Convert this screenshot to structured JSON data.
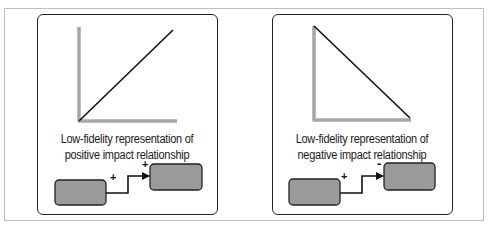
{
  "figure": {
    "panels": [
      {
        "id": "positive",
        "caption_line1": "Low-fidelity representation of",
        "caption_line2": "positive impact relationship",
        "graph": {
          "trend": "increasing",
          "line_start": [
            79,
            121
          ],
          "line_end": [
            173,
            30
          ]
        },
        "causal_link": {
          "source_sign": "+",
          "target_sign": "+"
        }
      },
      {
        "id": "negative",
        "caption_line1": "Low-fidelity representation of",
        "caption_line2": "negative impact relationship",
        "graph": {
          "trend": "decreasing",
          "line_start": [
            314,
            26
          ],
          "line_end": [
            410,
            118
          ]
        },
        "causal_link": {
          "source_sign": "+",
          "target_sign": "-"
        }
      }
    ],
    "colors": {
      "axis": "#a6a6a6",
      "trend_line": "#111111",
      "box_fill": "#9a9a9a",
      "box_stroke": "#222222",
      "panel_border": "#222222",
      "frame_border": "#bdbdbd"
    }
  }
}
